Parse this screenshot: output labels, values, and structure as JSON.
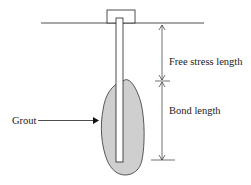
{
  "diagram": {
    "type": "ground-anchor-schematic",
    "labels": {
      "free_stress_length": "Free stress length",
      "bond_length": "Bond length",
      "grout": "Grout"
    },
    "colors": {
      "line": "#222222",
      "grout_fill": "#cfcfcf",
      "rod_fill": "#ffffff",
      "background": "#ffffff"
    }
  }
}
